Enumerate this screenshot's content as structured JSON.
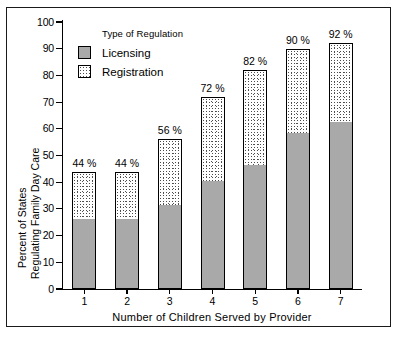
{
  "chart_data": {
    "type": "bar",
    "stacked": true,
    "title": "",
    "xlabel": "Number of Children Served by Provider",
    "ylabel": "Percent of States Regulating Family Day Care",
    "ylabel_line1": "Percent of States",
    "ylabel_line2": "Regulating Family Day Care",
    "categories": [
      "1",
      "2",
      "3",
      "4",
      "5",
      "6",
      "7"
    ],
    "ylim": [
      0,
      100
    ],
    "yticks": [
      0,
      10,
      20,
      30,
      40,
      50,
      60,
      70,
      80,
      90,
      100
    ],
    "ytick_labels": [
      "0",
      "10",
      "20",
      "30",
      "40",
      "50",
      "60",
      "70",
      "80",
      "90",
      "100"
    ],
    "grid": false,
    "legend_position": "upper-left-inside",
    "series": [
      {
        "name": "Licensing",
        "values": [
          26,
          26,
          31,
          40,
          46,
          58,
          62
        ]
      },
      {
        "name": "Registration",
        "values": [
          18,
          18,
          25,
          32,
          36,
          32,
          30
        ]
      }
    ],
    "totals": [
      44,
      44,
      56,
      72,
      82,
      90,
      92
    ],
    "data_labels": [
      "44 %",
      "44 %",
      "56 %",
      "72 %",
      "82 %",
      "90 %",
      "92 %"
    ],
    "colors": {
      "licensing": "#a9a9a9",
      "registration": "#ffffff",
      "outline": "#000000",
      "background": "#ffffff"
    }
  },
  "legend": {
    "title": "Type of Regulation",
    "items": [
      {
        "label": "Licensing"
      },
      {
        "label": "Registration"
      }
    ]
  }
}
